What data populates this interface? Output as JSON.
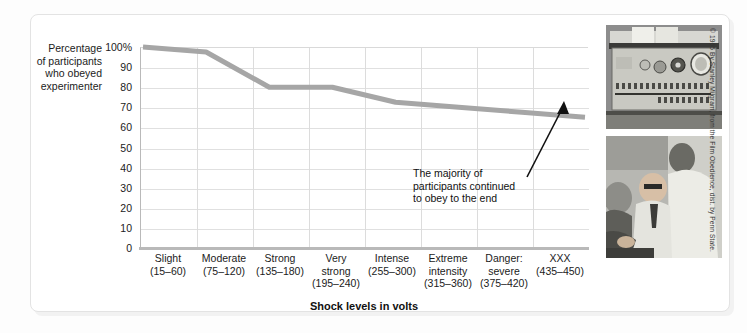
{
  "figure": {
    "y_axis_title": [
      "Percentage",
      "of participants",
      "who obeyed",
      "experimenter"
    ],
    "credit": "© 1965 By Stanley Milgram, from the Film Obedience, dist. by Penn State."
  },
  "annotation": {
    "line1": "The majority of",
    "line2": "participants continued",
    "line3": "to obey to the end"
  },
  "photos": [
    {
      "name": "shock-generator-photo",
      "alt": "Milgram shock generator control panel"
    },
    {
      "name": "experiment-session-photo",
      "alt": "Experimenter strapping learner into chair"
    }
  ],
  "chart_data": {
    "type": "line",
    "title": "",
    "xlabel": "Shock levels in volts",
    "ylabel": "Percentage of participants who obeyed experimenter",
    "categories": [
      "Slight\n(15–60)",
      "Moderate\n(75–120)",
      "Strong\n(135–180)",
      "Very\nstrong\n(195–240)",
      "Intense\n(255–300)",
      "Extreme\nintensity\n(315–360)",
      "Danger:\nsevere\n(375–420)",
      "XXX\n(435–450)"
    ],
    "category_names": [
      "Slight",
      "Moderate",
      "Strong",
      "Very strong",
      "Intense",
      "Extreme intensity",
      "Danger: severe",
      "XXX"
    ],
    "category_ranges": [
      "(15–60)",
      "(75–120)",
      "(135–180)",
      "(195–240)",
      "(255–300)",
      "(315–360)",
      "(375–420)",
      "(435–450)"
    ],
    "values": [
      100,
      97.5,
      80,
      80,
      72.5,
      70,
      67.5,
      65
    ],
    "ylim": [
      0,
      100
    ],
    "yticks": [
      0,
      10,
      20,
      30,
      40,
      50,
      60,
      70,
      80,
      90,
      100
    ],
    "ytick_labels": [
      "0",
      "10",
      "20",
      "30",
      "40",
      "50",
      "60",
      "70",
      "80",
      "90",
      "100%"
    ],
    "grid": true,
    "legend": "none",
    "line_color": "#a6a6a6",
    "line_width": 5
  }
}
